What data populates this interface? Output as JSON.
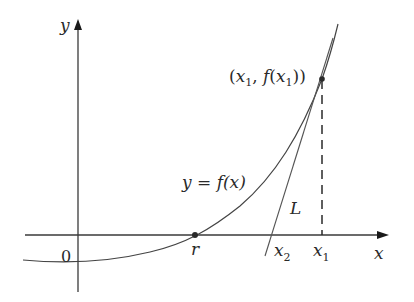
{
  "diagram": {
    "axes": {
      "x_label": "x",
      "y_label": "y",
      "origin_label": "0"
    },
    "curve": {
      "label_prefix": "y = ",
      "label_func": "f(x)"
    },
    "points": {
      "root_label": "r",
      "point_label_open": "(",
      "point_x": "x",
      "point_sub1": "1",
      "point_mid": ", ",
      "point_f": "f",
      "point_close": "))",
      "point_inner_open": "(",
      "x2_base": "x",
      "x2_sub": "2",
      "x1_base": "x",
      "x1_sub": "1"
    },
    "tangent": {
      "label": "L"
    },
    "colors": {
      "stroke": "#3a3a3a",
      "text": "#2a2a2a",
      "background": "#ffffff"
    }
  }
}
